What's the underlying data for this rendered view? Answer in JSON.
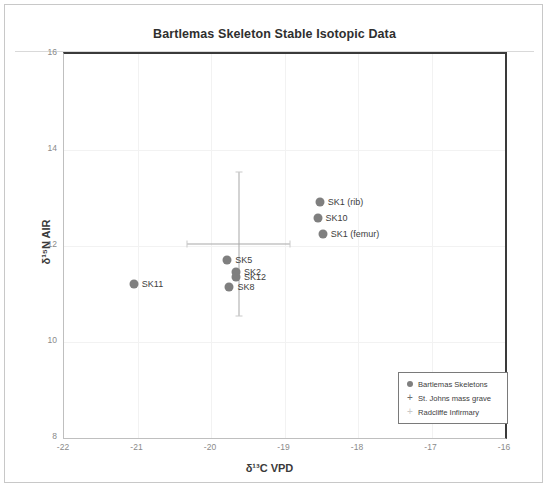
{
  "chart_data": {
    "type": "scatter",
    "title": "Bartlemas Skeleton Stable Isotopic Data",
    "xlabel": "δ¹³C VPD",
    "ylabel": "δ¹⁵N AIR",
    "xlim": [
      -22,
      -16
    ],
    "ylim": [
      8,
      16
    ],
    "xticks": [
      "-22",
      "-21",
      "-20",
      "-19",
      "-18",
      "-17",
      "-16"
    ],
    "yticks": [
      "8",
      "10",
      "12",
      "14",
      "16"
    ],
    "grid": true,
    "legend_position": "bottom-right",
    "series": [
      {
        "name": "Bartlemas Skeletons",
        "marker": "circle",
        "color": "#7f7f7f",
        "points": [
          {
            "label": "SK1 (rib)",
            "x": -18.52,
            "y": 12.92
          },
          {
            "label": "SK10",
            "x": -18.55,
            "y": 12.58
          },
          {
            "label": "SK1 (femur)",
            "x": -18.48,
            "y": 12.25
          },
          {
            "label": "SK5",
            "x": -19.78,
            "y": 11.7
          },
          {
            "label": "SK2",
            "x": -19.66,
            "y": 11.45
          },
          {
            "label": "SK12",
            "x": -19.66,
            "y": 11.35
          },
          {
            "label": "SK8",
            "x": -19.75,
            "y": 11.15
          },
          {
            "label": "SK11",
            "x": -21.05,
            "y": 11.2
          }
        ]
      },
      {
        "name": "St. Johns mass grave",
        "marker": "plus",
        "color": "#a8a8a8",
        "points": [
          {
            "x": -19.62,
            "y": 12.05,
            "xerr": 0.7,
            "yerr": 1.5
          }
        ]
      },
      {
        "name": "Radcliffe Infirmary",
        "marker": "plus",
        "color": "#c9c9c9",
        "points": []
      }
    ]
  },
  "legend": {
    "items": [
      {
        "marker": "●",
        "label": "Bartlemas Skeletons"
      },
      {
        "marker": "+",
        "label": "St. Johns mass grave"
      },
      {
        "marker": "+",
        "label": "Radcliffe Infirmary"
      }
    ]
  }
}
